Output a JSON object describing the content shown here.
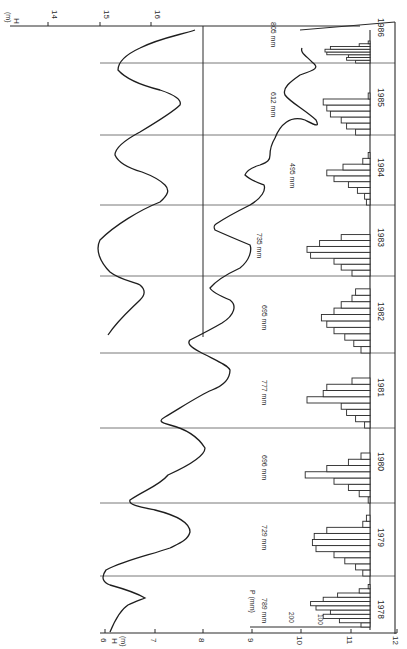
{
  "chart_data": {
    "type": "line+bar",
    "title": "",
    "orientation": "rotated 90deg clockwise (time runs bottom to top)",
    "years": [
      "1978",
      "1979",
      "1980",
      "1981",
      "1982",
      "1983",
      "1984",
      "1985",
      "1986"
    ],
    "annual_precipitation_labels": [
      "789 mm",
      "729 mm",
      "696 mm",
      "777 mm",
      "695 mm",
      "735 mm",
      "495 mm",
      "612 mm",
      "805 mm"
    ],
    "annual_precipitation_mm": [
      789,
      729,
      696,
      777,
      695,
      735,
      495,
      612,
      805
    ],
    "axes": {
      "water_level_lower": {
        "label": "H (m)",
        "ticks": [
          "6",
          "7",
          "8",
          "9",
          "10",
          "11",
          "12"
        ],
        "range": [
          6,
          12
        ]
      },
      "water_level_upper": {
        "label": "H (m)",
        "ticks": [
          "14",
          "15",
          "16"
        ],
        "range": [
          13.2,
          16.4
        ]
      },
      "precipitation": {
        "label": "P (mm)",
        "ticks": [
          "200",
          "100"
        ]
      }
    },
    "series": [
      {
        "name": "Water level H, well 1 (upper scale 14-16 m)",
        "years_covered": "1983-1986",
        "extrema": [
          {
            "year": 1983,
            "min_H": 14.1,
            "max_H": 15.3
          },
          {
            "year": 1984,
            "min_H": 13.6,
            "max_H": 15.7
          },
          {
            "year": 1985,
            "min_H": 14.0,
            "max_H": 15.5
          },
          {
            "year": 1986,
            "min_H": 14.4,
            "max_H": 16.0
          }
        ]
      },
      {
        "name": "Water level H, well 2 (lower scale 6-12 m)",
        "years_covered": "1978-1986",
        "extrema": [
          {
            "year": 1978,
            "high_H": 6.1,
            "low_H": 6.8
          },
          {
            "year": 1979,
            "high_H": 6.6,
            "low_H": 7.6
          },
          {
            "year": 1980,
            "high_H": 7.2,
            "low_H": 7.9
          },
          {
            "year": 1981,
            "high_H": 7.6,
            "low_H": 8.6
          },
          {
            "year": 1982,
            "high_H": 8.0,
            "low_H": 8.7
          },
          {
            "year": 1983,
            "high_H": 8.2,
            "low_H": 9.0
          },
          {
            "year": 1984,
            "high_H": 9.0,
            "low_H": 9.4
          },
          {
            "year": 1985,
            "high_H": 9.2,
            "low_H": 10.4
          },
          {
            "year": 1986,
            "high_H": 9.2,
            "low_H": 10.4
          }
        ]
      },
      {
        "name": "Monthly precipitation P (mm)",
        "type": "bar",
        "monthly_mm": {
          "1978": [
            25,
            85,
            130,
            110,
            150,
            165,
            130,
            90,
            30,
            5,
            0,
            0
          ],
          "1979": [
            20,
            40,
            70,
            100,
            150,
            160,
            155,
            120,
            20,
            10,
            0,
            0
          ],
          "1980": [
            5,
            30,
            60,
            100,
            180,
            120,
            60,
            25,
            0,
            0,
            0,
            0
          ],
          "1981": [
            15,
            40,
            65,
            80,
            175,
            130,
            120,
            50,
            0,
            0,
            0,
            0
          ],
          "1982": [
            25,
            45,
            70,
            100,
            120,
            135,
            100,
            80,
            50,
            40,
            0,
            0
          ],
          "1983": [
            50,
            80,
            100,
            165,
            175,
            140,
            80,
            0,
            0,
            0,
            0,
            0
          ],
          "1984": [
            10,
            15,
            35,
            60,
            100,
            120,
            75,
            20,
            5,
            0,
            0,
            0
          ],
          "1985": [
            40,
            65,
            80,
            110,
            120,
            130,
            5,
            0,
            0,
            0,
            0,
            0
          ],
          "1986": [
            40,
            65,
            60,
            120,
            125,
            110,
            30,
            5,
            0,
            0,
            0,
            0
          ]
        }
      }
    ],
    "grid": false,
    "legend": "none"
  },
  "labels": {
    "h_lower": "H",
    "h_lower_unit": "(m)",
    "h_upper": "H",
    "h_upper_unit": "(m)",
    "p_axis": "P (mm)",
    "p_tick_200": "200",
    "p_tick_100": "100",
    "tick_6": "6",
    "tick_7": "7",
    "tick_8": "8",
    "tick_9": "9",
    "tick_10": "10",
    "tick_11": "11",
    "tick_12": "12",
    "tick_14": "14",
    "tick_15": "15",
    "tick_16": "16",
    "y1978": "1978",
    "y1979": "1979",
    "y1980": "1980",
    "y1981": "1981",
    "y1982": "1982",
    "y1983": "1983",
    "y1984": "1984",
    "y1985": "1985",
    "y1986": "1986",
    "p1978": "789 mm",
    "p1979": "729 mm",
    "p1980": "696 mm",
    "p1981": "777 mm",
    "p1982": "695 mm",
    "p1983": "735 mm",
    "p1984": "495 mm",
    "p1985": "612 mm",
    "p1986": "805 mm"
  }
}
